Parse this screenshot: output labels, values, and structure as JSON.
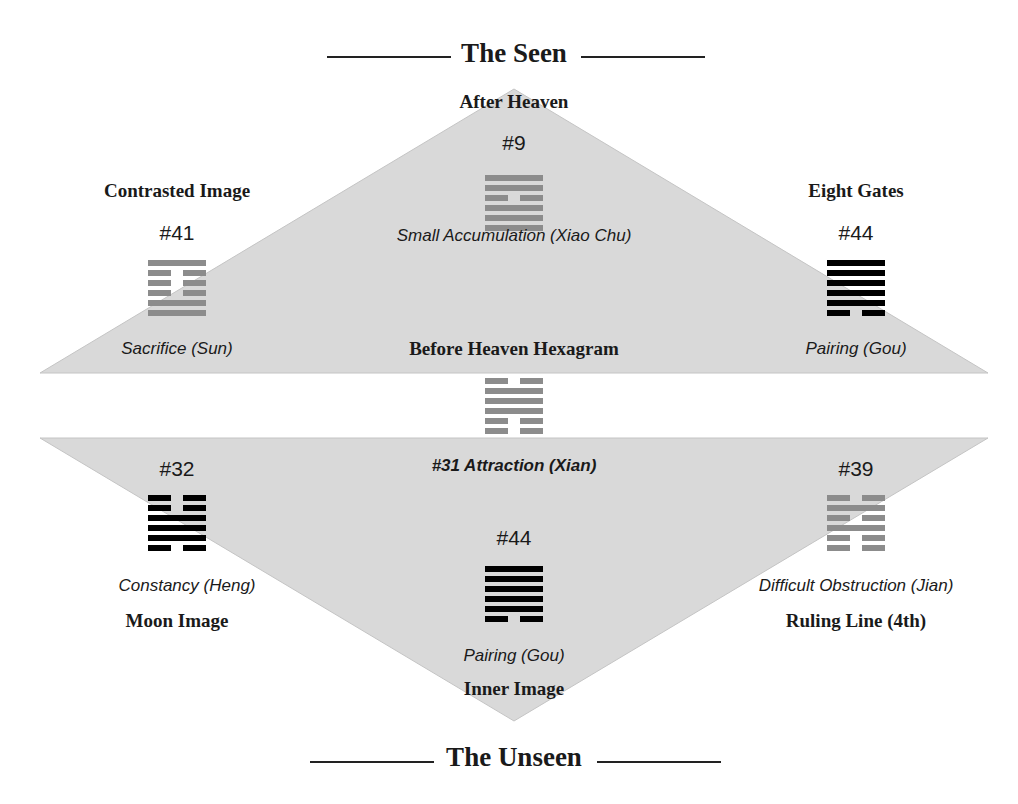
{
  "colors": {
    "triangle_fill": "#d9d9d9",
    "triangle_stroke": "#c4c4c4",
    "gray_hexagram": "#8c8c8c",
    "black_hexagram": "#000000",
    "text": "#1a1a1a"
  },
  "header": {
    "title": "The Seen"
  },
  "footer": {
    "title": "The Unseen"
  },
  "upper_triangle": {
    "top": {
      "label": "After Heaven",
      "number": "#9",
      "name": "Small Accumulation (Xiao Chu)",
      "lines_top_to_bottom": [
        "solid",
        "solid",
        "broken",
        "solid",
        "solid",
        "solid"
      ],
      "color": "gray"
    },
    "left": {
      "label": "Contrasted Image",
      "number": "#41",
      "name": "Sacrifice (Sun)",
      "lines_top_to_bottom": [
        "solid",
        "broken",
        "broken",
        "broken",
        "solid",
        "solid"
      ],
      "color": "gray"
    },
    "right": {
      "label": "Eight Gates",
      "number": "#44",
      "name": "Pairing (Gou)",
      "lines_top_to_bottom": [
        "solid",
        "solid",
        "solid",
        "solid",
        "solid",
        "broken"
      ],
      "color": "black"
    }
  },
  "center": {
    "label": "Before Heaven Hexagram",
    "name": "#31 Attraction (Xian)",
    "lines_top_to_bottom": [
      "broken",
      "solid",
      "solid",
      "solid",
      "broken",
      "broken"
    ],
    "color": "gray"
  },
  "lower_triangle": {
    "left": {
      "label": "Moon Image",
      "number": "#32",
      "name": "Constancy (Heng)",
      "lines_top_to_bottom": [
        "broken",
        "broken",
        "solid",
        "solid",
        "solid",
        "broken"
      ],
      "color": "black"
    },
    "right": {
      "label": "Ruling Line (4th)",
      "number": "#39",
      "name": "Difficult Obstruction (Jian)",
      "lines_top_to_bottom": [
        "broken",
        "solid",
        "broken",
        "solid",
        "broken",
        "broken"
      ],
      "color": "gray"
    },
    "bottom": {
      "label": "Inner Image",
      "number": "#44",
      "name": "Pairing (Gou)",
      "lines_top_to_bottom": [
        "solid",
        "solid",
        "solid",
        "solid",
        "solid",
        "broken"
      ],
      "color": "black"
    }
  }
}
